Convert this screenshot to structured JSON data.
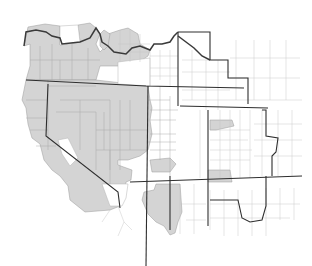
{
  "map": {
    "title": "",
    "description": "County-level map of the western United States with selected counties shaded gray",
    "colors": {
      "background": "#ffffff",
      "shaded_fill": "#d4d4d4",
      "unshaded_fill": "#ffffff",
      "county_border": "#a8a8a8",
      "state_border": "#2e2e2e",
      "region_border": "#3a3a3a"
    },
    "legend": [
      {
        "label": "Shaded counties",
        "color": "#d4d4d4"
      },
      {
        "label": "Unshaded counties",
        "color": "#ffffff"
      }
    ],
    "regions_shaded": [
      "Oregon (most counties)",
      "Northern California",
      "Nevada (most counties)",
      "Idaho (western/northern counties)",
      "Western Utah",
      "Western Arizona",
      "Select counties in Colorado"
    ],
    "regions_unshaded": [
      "Wyoming",
      "Eastern Utah",
      "Colorado (most)",
      "New Mexico",
      "Southern California",
      "Eastern Arizona"
    ]
  }
}
